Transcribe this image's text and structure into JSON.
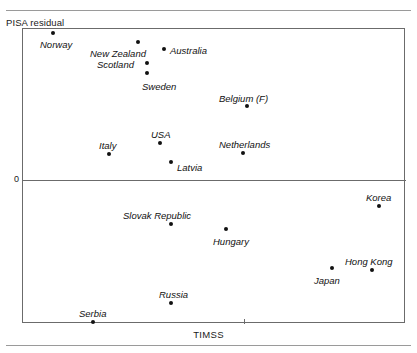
{
  "figure": {
    "y_axis_title": "PISA residual",
    "x_axis_title": "TIMSS",
    "zero_label": "0"
  },
  "chart_data": {
    "type": "scatter",
    "title": "",
    "subtitle": "",
    "xlabel": "TIMSS",
    "ylabel": "PISA residual",
    "grid": false,
    "legend": "none",
    "axis_notes": "Unlabeled axes except a single '0' reference line on the y-axis and one unlabeled tick on the x-axis.",
    "reference_lines": [
      {
        "axis": "y",
        "value": 0,
        "label": "0"
      }
    ],
    "points": [
      {
        "name": "Norway",
        "px": 52,
        "py": 32,
        "label_dx": -13,
        "label_dy": 14,
        "sign": "positive"
      },
      {
        "name": "New Zealand",
        "px": 137,
        "py": 41,
        "label_dx": -48,
        "label_dy": 14,
        "sign": "positive"
      },
      {
        "name": "Australia",
        "px": 163,
        "py": 48,
        "label_dx": 6,
        "label_dy": 4,
        "sign": "positive"
      },
      {
        "name": "Scotland",
        "px": 146,
        "py": 62,
        "label_dx": -50,
        "label_dy": 4,
        "sign": "positive"
      },
      {
        "name": "Sweden",
        "px": 146,
        "py": 72,
        "label_dx": -5,
        "label_dy": 16,
        "sign": "positive"
      },
      {
        "name": "Belgium (F)",
        "px": 246,
        "py": 105,
        "label_dx": -28,
        "label_dy": -5,
        "sign": "positive"
      },
      {
        "name": "USA",
        "px": 159,
        "py": 142,
        "label_dx": -9,
        "label_dy": -6,
        "sign": "positive"
      },
      {
        "name": "Netherlands",
        "px": 242,
        "py": 152,
        "label_dx": -24,
        "label_dy": -6,
        "sign": "positive"
      },
      {
        "name": "Italy",
        "px": 108,
        "py": 153,
        "label_dx": -10,
        "label_dy": -6,
        "sign": "positive"
      },
      {
        "name": "Latvia",
        "px": 170,
        "py": 161,
        "label_dx": 6,
        "label_dy": 8,
        "sign": "positive"
      },
      {
        "name": "Korea",
        "px": 378,
        "py": 205,
        "label_dx": -13,
        "label_dy": -6,
        "sign": "negative"
      },
      {
        "name": "Slovak Republic",
        "px": 170,
        "py": 223,
        "label_dx": -48,
        "label_dy": -6,
        "sign": "negative"
      },
      {
        "name": "Hungary",
        "px": 225,
        "py": 228,
        "label_dx": -13,
        "label_dy": 15,
        "sign": "negative"
      },
      {
        "name": "Japan",
        "px": 331,
        "py": 267,
        "label_dx": -18,
        "label_dy": 15,
        "sign": "negative"
      },
      {
        "name": "Hong Kong",
        "px": 371,
        "py": 269,
        "label_dx": -27,
        "label_dy": -6,
        "sign": "negative"
      },
      {
        "name": "Russia",
        "px": 170,
        "py": 302,
        "label_dx": -12,
        "label_dy": -6,
        "sign": "negative"
      },
      {
        "name": "Serbia",
        "px": 92,
        "py": 321,
        "label_dx": -14,
        "label_dy": -6,
        "sign": "negative"
      }
    ],
    "x_ticks": [
      {
        "px": 243,
        "label": ""
      }
    ]
  },
  "geometry": {
    "plot_left": 22,
    "plot_top": 28,
    "plot_width": 383,
    "plot_height": 295,
    "zero_y": 179
  }
}
